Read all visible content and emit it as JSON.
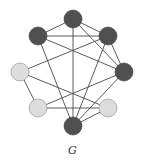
{
  "caption": "G",
  "colors": {
    "dark_node": "#505050",
    "light_node": "#dcdcdc",
    "edge": "#4a4a4a"
  },
  "nodes": [
    {
      "id": "A",
      "position": "top",
      "x": 73,
      "y": 19,
      "shade": "dark"
    },
    {
      "id": "B",
      "position": "upper-left",
      "x": 38,
      "y": 36,
      "shade": "dark"
    },
    {
      "id": "C",
      "position": "upper-right",
      "x": 108,
      "y": 36,
      "shade": "dark"
    },
    {
      "id": "D",
      "position": "right",
      "x": 124,
      "y": 72,
      "shade": "dark"
    },
    {
      "id": "E",
      "position": "left",
      "x": 20,
      "y": 72,
      "shade": "light"
    },
    {
      "id": "F",
      "position": "lower-left",
      "x": 38,
      "y": 108,
      "shade": "light"
    },
    {
      "id": "H",
      "position": "lower-right",
      "x": 108,
      "y": 108,
      "shade": "light"
    },
    {
      "id": "I",
      "position": "bottom",
      "x": 73,
      "y": 126,
      "shade": "dark"
    }
  ],
  "edges": [
    [
      "A",
      "B"
    ],
    [
      "A",
      "C"
    ],
    [
      "A",
      "D"
    ],
    [
      "A",
      "I"
    ],
    [
      "B",
      "C"
    ],
    [
      "B",
      "D"
    ],
    [
      "B",
      "I"
    ],
    [
      "C",
      "D"
    ],
    [
      "C",
      "E"
    ],
    [
      "C",
      "I"
    ],
    [
      "D",
      "F"
    ],
    [
      "D",
      "I"
    ],
    [
      "E",
      "F"
    ],
    [
      "E",
      "H"
    ],
    [
      "F",
      "H"
    ],
    [
      "H",
      "I"
    ]
  ],
  "node_radius": 9
}
